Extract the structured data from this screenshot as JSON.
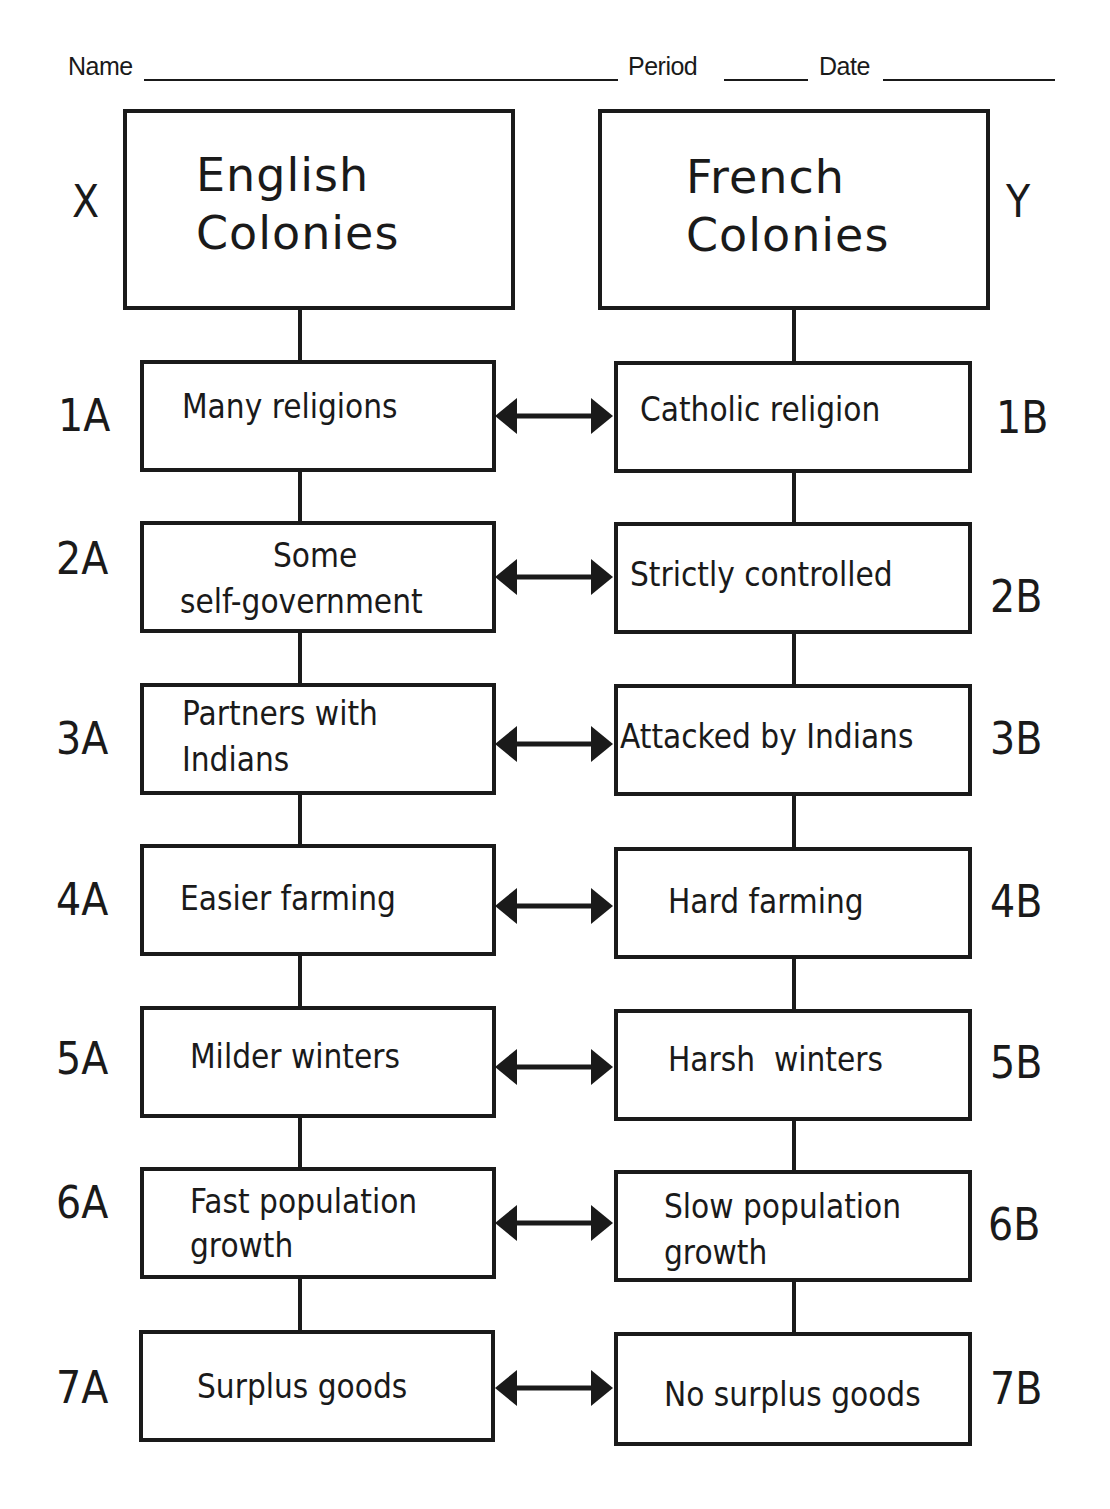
{
  "worksheet": {
    "header": {
      "name_label": "Name",
      "period_label": "Period",
      "date_label": "Date"
    },
    "columns": {
      "left": {
        "marker": "X",
        "title_line1": "English",
        "title_line2": "Colonies"
      },
      "right": {
        "marker": "Y",
        "title_line1": "French",
        "title_line2": "Colonies"
      }
    },
    "rows": [
      {
        "left_label": "1A",
        "left_text": [
          "Many religions"
        ],
        "right_label": "1B",
        "right_text": [
          "Catholic religion"
        ]
      },
      {
        "left_label": "2A",
        "left_text": [
          "Some",
          "self-government"
        ],
        "right_label": "2B",
        "right_text": [
          "Strictly controlled"
        ]
      },
      {
        "left_label": "3A",
        "left_text": [
          "Partners with",
          "Indians"
        ],
        "right_label": "3B",
        "right_text": [
          "Attacked by Indians"
        ]
      },
      {
        "left_label": "4A",
        "left_text": [
          "Easier farming"
        ],
        "right_label": "4B",
        "right_text": [
          "Hard farming"
        ]
      },
      {
        "left_label": "5A",
        "left_text": [
          "Milder winters"
        ],
        "right_label": "5B",
        "right_text": [
          "Harsh  winters"
        ]
      },
      {
        "left_label": "6A",
        "left_text": [
          "Fast population",
          "growth"
        ],
        "right_label": "6B",
        "right_text": [
          "Slow population",
          "growth"
        ]
      },
      {
        "left_label": "7A",
        "left_text": [
          "Surplus goods"
        ],
        "right_label": "7B",
        "right_text": [
          "No surplus goods"
        ]
      }
    ],
    "connector": "double-headed-arrow"
  }
}
